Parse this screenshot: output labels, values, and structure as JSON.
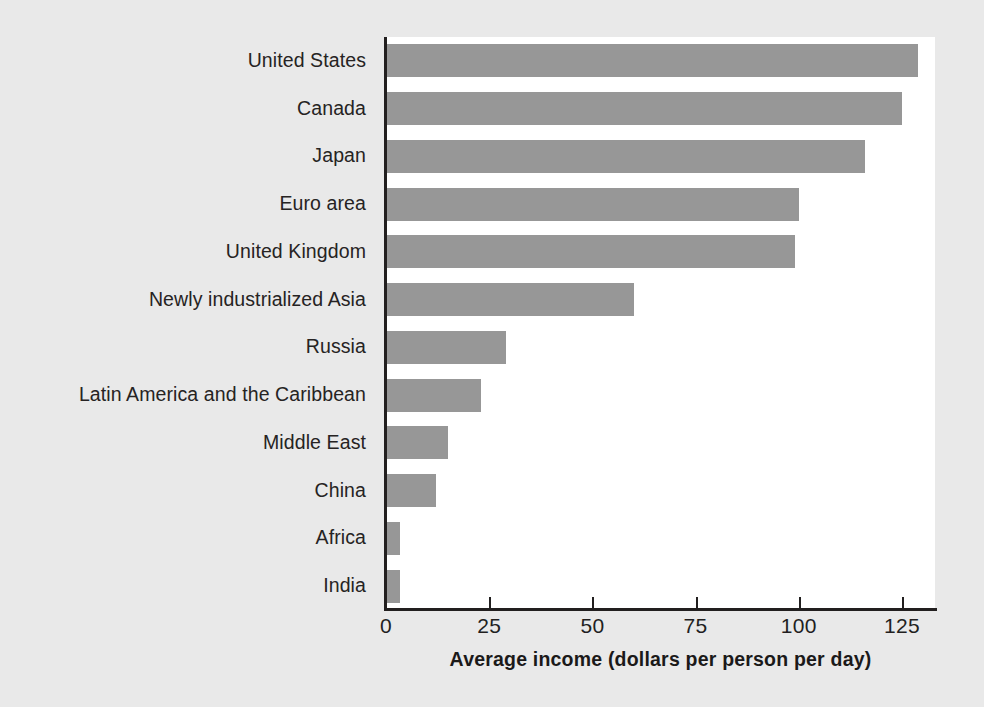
{
  "chart_data": {
    "type": "bar",
    "orientation": "horizontal",
    "title": "",
    "xlabel": "Average income (dollars per person per day)",
    "ylabel": "",
    "xlim": [
      0,
      133
    ],
    "xticks": [
      0,
      25,
      50,
      75,
      100,
      125
    ],
    "xtick_labels": [
      "0",
      "25",
      "50",
      "75",
      "100",
      "125"
    ],
    "grid": false,
    "legend": null,
    "bar_color": "#979797",
    "categories": [
      "United States",
      "Canada",
      "Japan",
      "Euro area",
      "United Kingdom",
      "Newly industrialized Asia",
      "Russia",
      "Latin America and the Caribbean",
      "Middle East",
      "China",
      "Africa",
      "India"
    ],
    "values": [
      129,
      125,
      116,
      100,
      99,
      60,
      29,
      23,
      15,
      12,
      3.5,
      3.5
    ]
  }
}
